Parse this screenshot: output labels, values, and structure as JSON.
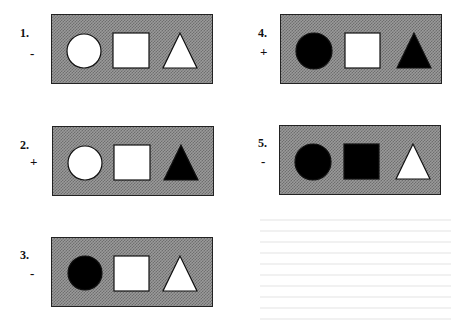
{
  "figure": {
    "items": [
      {
        "number": "1.",
        "sign": "-",
        "shapes": {
          "circle": "white",
          "square": "white",
          "triangle": "white"
        }
      },
      {
        "number": "2.",
        "sign": "+",
        "shapes": {
          "circle": "white",
          "square": "white",
          "triangle": "black"
        }
      },
      {
        "number": "3.",
        "sign": "-",
        "shapes": {
          "circle": "black",
          "square": "white",
          "triangle": "white"
        }
      },
      {
        "number": "4.",
        "sign": "+",
        "shapes": {
          "circle": "black",
          "square": "white",
          "triangle": "black"
        }
      },
      {
        "number": "5.",
        "sign": "-",
        "shapes": {
          "circle": "black",
          "square": "black",
          "triangle": "white"
        }
      }
    ],
    "colors": {
      "white": "#ffffff",
      "black": "#000000",
      "panel_bg": "#8c8c8c",
      "outline": "#111111"
    }
  }
}
